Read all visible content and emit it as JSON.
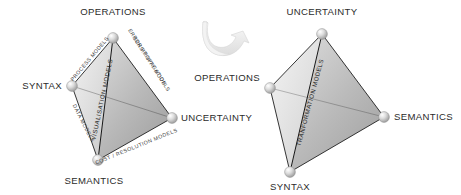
{
  "figure": {
    "background_color": "#ffffff",
    "vertex_label_color": "#2b2b2b",
    "edge_line_color": "#1f1f1f",
    "node_color": "#c9c9c9"
  },
  "left_tetrahedron": {
    "name": "left-tetrahedron",
    "vertices": [
      {
        "id": "operations",
        "label": "OPERATIONS",
        "x": 113,
        "y": 38,
        "label_x": 113,
        "label_y": 15,
        "anchor": "middle"
      },
      {
        "id": "syntax",
        "label": "SYNTAX",
        "x": 72,
        "y": 86,
        "label_x": 62,
        "label_y": 89,
        "anchor": "end"
      },
      {
        "id": "uncertainty",
        "label": "UNCERTAINTY",
        "x": 172,
        "y": 118,
        "label_x": 181,
        "label_y": 121,
        "anchor": "start"
      },
      {
        "id": "semantics",
        "label": "SEMANTICS",
        "x": 98,
        "y": 160,
        "label_x": 94,
        "label_y": 184,
        "anchor": "middle"
      }
    ],
    "edge_labels": [
      {
        "id": "process-models",
        "lines": [
          "PROCESS MODELS"
        ],
        "x": 91,
        "y": 60,
        "rotate": -50,
        "emphasis": "normal"
      },
      {
        "id": "error-propagation-models",
        "lines": [
          "ERROR PROPAGATION",
          "SENSITIVITY MODELS"
        ],
        "x": 146,
        "y": 61,
        "rotate": 57,
        "emphasis": "normal"
      },
      {
        "id": "data-models",
        "lines": [
          "DATA MODELS"
        ],
        "x": 82,
        "y": 124,
        "rotate": 63,
        "emphasis": "normal"
      },
      {
        "id": "cost-resolution-models",
        "lines": [
          "COST / RESOLUTION MODELS"
        ],
        "x": 137,
        "y": 148,
        "rotate": -22,
        "emphasis": "normal"
      },
      {
        "id": "visualisation-models",
        "lines": [
          "VISUALISATION MODELS"
        ],
        "x": 104,
        "y": 100,
        "rotate": -78,
        "emphasis": "bold"
      }
    ]
  },
  "right_tetrahedron": {
    "name": "right-tetrahedron",
    "vertices": [
      {
        "id": "uncertainty",
        "label": "UNCERTAINTY",
        "x": 322,
        "y": 34,
        "label_x": 322,
        "label_y": 15,
        "anchor": "middle"
      },
      {
        "id": "operations",
        "label": "OPERATIONS",
        "x": 270,
        "y": 88,
        "label_x": 260,
        "label_y": 81,
        "anchor": "end"
      },
      {
        "id": "semantics",
        "label": "SEMANTICS",
        "x": 384,
        "y": 117,
        "label_x": 394,
        "label_y": 120,
        "anchor": "start"
      },
      {
        "id": "syntax",
        "label": "SYNTAX",
        "x": 290,
        "y": 172,
        "label_x": 290,
        "label_y": 190,
        "anchor": "middle"
      }
    ],
    "edge_labels": [
      {
        "id": "tranformation-models",
        "lines": [
          "TRANFORMATION MODELS"
        ],
        "x": 312,
        "y": 103,
        "rotate": -75,
        "emphasis": "bold"
      }
    ]
  },
  "arrow": {
    "name": "curved-transition-arrow",
    "direction": "right",
    "style": "3d-ribbon",
    "color": "#e8e8e8"
  }
}
